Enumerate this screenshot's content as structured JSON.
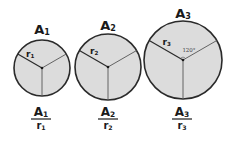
{
  "colors": {
    "circle_fill": "#dcdcdc",
    "circle_stroke": "#2a2a2a",
    "radius_line": "#555555",
    "ink": "#1a1a1a"
  },
  "circles": [
    {
      "area_label": "A",
      "area_sub": "1",
      "radius_label": "r",
      "radius_sub": "1",
      "fraction_num": "A",
      "fraction_num_sub": "1",
      "fraction_den": "r",
      "fraction_den_sub": "1",
      "angle_label": ""
    },
    {
      "area_label": "A",
      "area_sub": "2",
      "radius_label": "r",
      "radius_sub": "2",
      "fraction_num": "A",
      "fraction_num_sub": "2",
      "fraction_den": "r",
      "fraction_den_sub": "2",
      "angle_label": ""
    },
    {
      "area_label": "A",
      "area_sub": "3",
      "radius_label": "r",
      "radius_sub": "3",
      "fraction_num": "A",
      "fraction_num_sub": "3",
      "fraction_den": "r",
      "fraction_den_sub": "3",
      "angle_label": "120°"
    }
  ]
}
